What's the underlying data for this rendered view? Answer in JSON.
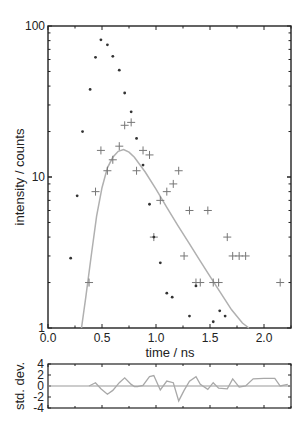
{
  "chart_data": [
    {
      "type": "scatter",
      "panel": "main",
      "title": "",
      "xlabel": "time / ns",
      "ylabel": "intensity / counts",
      "yscale": "log",
      "xlim": [
        0.0,
        2.25
      ],
      "ylim": [
        1,
        100
      ],
      "x_ticks": [
        0.0,
        0.5,
        1.0,
        1.5,
        2.0
      ],
      "x_tick_labels": [
        "0.0",
        "0.5",
        "1.0",
        "1.5",
        "2.0"
      ],
      "y_ticks": [
        1,
        10,
        100
      ],
      "y_tick_labels": [
        "1",
        "10",
        "100"
      ],
      "grid": false,
      "legend": null,
      "series": [
        {
          "name": "instrument response (dots)",
          "marker": "dot",
          "color": "#333333",
          "x": [
            0.21,
            0.27,
            0.32,
            0.39,
            0.44,
            0.49,
            0.55,
            0.6,
            0.66,
            0.71,
            0.77,
            0.82,
            0.88,
            0.94,
            0.98,
            1.04,
            1.1,
            1.15,
            1.31,
            1.37,
            1.53,
            1.59,
            1.64
          ],
          "y": [
            2.9,
            7.5,
            20,
            38,
            62,
            81,
            75,
            63,
            51,
            36,
            27,
            18,
            12,
            6.6,
            4,
            2.7,
            1.7,
            1.6,
            1.2,
            1.9,
            1.1,
            1.3,
            1.2
          ]
        },
        {
          "name": "decay counts (crosses)",
          "marker": "cross",
          "color": "#777777",
          "x": [
            0.38,
            0.44,
            0.49,
            0.55,
            0.6,
            0.66,
            0.71,
            0.77,
            0.82,
            0.88,
            0.94,
            0.98,
            1.04,
            1.1,
            1.16,
            1.21,
            1.26,
            1.31,
            1.37,
            1.41,
            1.48,
            1.53,
            1.58,
            1.66,
            1.71,
            1.77,
            1.83,
            2.15
          ],
          "y": [
            2,
            8,
            15,
            11,
            13,
            16,
            22,
            23,
            11,
            15,
            14,
            4,
            7,
            8,
            9,
            11,
            3,
            6,
            2,
            2,
            6,
            2,
            2,
            4,
            3,
            3,
            3,
            2
          ]
        },
        {
          "name": "fit",
          "type": "line",
          "color": "#b0b0b0",
          "x": [
            0.31,
            0.35,
            0.4,
            0.45,
            0.5,
            0.55,
            0.6,
            0.65,
            0.7,
            0.75,
            0.8,
            0.9,
            1.0,
            1.1,
            1.2,
            1.3,
            1.4,
            1.5,
            1.6,
            1.7,
            1.8,
            1.86
          ],
          "y": [
            1.0,
            1.6,
            3.0,
            5.5,
            8.5,
            11.5,
            13.5,
            14.8,
            15.2,
            14.6,
            13.5,
            10.8,
            8.3,
            6.3,
            4.8,
            3.7,
            2.85,
            2.2,
            1.7,
            1.32,
            1.08,
            1.0
          ]
        }
      ]
    },
    {
      "type": "line",
      "panel": "residuals",
      "xlabel": "",
      "ylabel": "std. dev.",
      "xlim": [
        0.0,
        2.25
      ],
      "ylim": [
        -4,
        4
      ],
      "y_ticks": [
        -4,
        -2,
        0,
        2,
        4
      ],
      "y_tick_labels": [
        "-4",
        "-2",
        "0",
        "2",
        "4"
      ],
      "series": [
        {
          "name": "residuals",
          "color": "#a8a8a8",
          "x": [
            0.38,
            0.44,
            0.49,
            0.55,
            0.6,
            0.66,
            0.71,
            0.77,
            0.8,
            0.83,
            0.88,
            0.94,
            0.98,
            1.04,
            1.1,
            1.12,
            1.16,
            1.21,
            1.26,
            1.31,
            1.37,
            1.41,
            1.48,
            1.53,
            1.58,
            1.66,
            1.71,
            1.77,
            1.83,
            1.9,
            2.0,
            2.1,
            2.15,
            2.22
          ],
          "y": [
            0.0,
            0.6,
            -0.5,
            -1.5,
            -0.8,
            0.6,
            1.5,
            0.3,
            -0.1,
            -0.1,
            0.1,
            1.7,
            1.9,
            -0.7,
            0.9,
            0.8,
            0.6,
            -2.7,
            -0.8,
            0.9,
            1.7,
            0.3,
            -0.6,
            0.6,
            -0.4,
            -0.5,
            1.3,
            -0.2,
            0.0,
            1.3,
            1.4,
            1.4,
            0.0,
            0.3
          ]
        }
      ],
      "zero_line_color": "#999999"
    }
  ],
  "labels": {
    "xlabel": "time / ns",
    "ylabel_main": "intensity / counts",
    "ylabel_resid": "std. dev."
  }
}
